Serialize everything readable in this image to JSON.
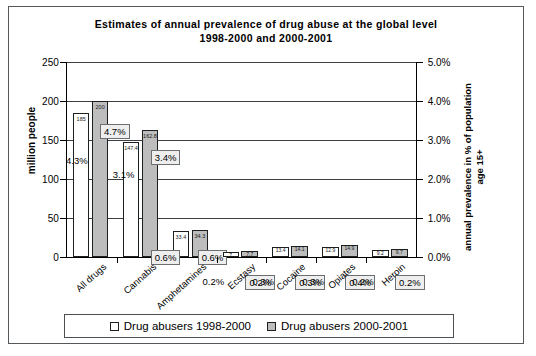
{
  "chart_data": {
    "type": "bar",
    "title": "Estimates of annual prevalence of drug abuse at the global level",
    "subtitle": "1998-2000 and 2000-2001",
    "xlabel": "",
    "ylabel": "million people",
    "ylabel_secondary": "annual prevalence in % of population age 15+",
    "ylim": [
      0,
      250
    ],
    "yticks": [
      "0",
      "50",
      "100",
      "150",
      "200",
      "250"
    ],
    "ylim_secondary": [
      0,
      5
    ],
    "yticks_secondary": [
      "0.0%",
      "1.0%",
      "2.0%",
      "3.0%",
      "4.0%",
      "5.0%"
    ],
    "grid": true,
    "legend_position": "bottom",
    "categories": [
      "All drugs",
      "Cannabis",
      "Amphetamines",
      "Ecstasy",
      "Cocaine",
      "Opiates",
      "Heroin"
    ],
    "series": [
      {
        "name": "Drug abusers 1998-2000",
        "color": "#ffffff",
        "values": [
          185,
          147.4,
          33.4,
          7,
          13.4,
          12.9,
          9.2
        ],
        "value_labels": [
          "185",
          "147.4",
          "33.4",
          "7",
          "13.4",
          "12.9",
          "9.2"
        ],
        "percent_labels": [
          "4.3%",
          "3.1%",
          "0.6%",
          "0.2%",
          "0.3%",
          "0.3%",
          "0.2%"
        ]
      },
      {
        "name": "Drug abusers 2000-2001",
        "color": "#bdbdbd",
        "values": [
          200,
          162.8,
          34.3,
          7.7,
          14.1,
          14.9,
          9.7
        ],
        "value_labels": [
          "200",
          "162.8",
          "34.3",
          "7.7",
          "14.1",
          "14.9",
          "9.7"
        ],
        "percent_labels": [
          "4.7%",
          "3.4%",
          "0.6%",
          "0.2%",
          "0.3%",
          "0.4%",
          "0.2%"
        ]
      }
    ]
  },
  "legend": {
    "items": [
      {
        "label": "Drug abusers 1998-2000"
      },
      {
        "label": "Drug abusers 2000-2001"
      }
    ]
  }
}
